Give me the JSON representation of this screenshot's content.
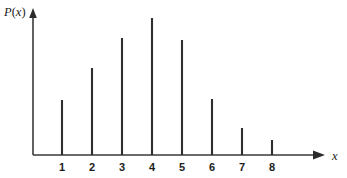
{
  "figure": {
    "background_color": "#ffffff",
    "line_color": "#2e2e2e",
    "axis_color": "#3a3a3a"
  },
  "axes": {
    "y_label_parts": {
      "symbol": "P",
      "open_paren": "(",
      "variable": "x",
      "close_paren": ")"
    },
    "y_label": "P(x)",
    "x_label": "x"
  },
  "chart_data": {
    "type": "bar",
    "title": "",
    "subtitle": "",
    "xlabel": "x",
    "ylabel": "P(x)",
    "categories": [
      "1",
      "2",
      "3",
      "4",
      "5",
      "6",
      "7",
      "8"
    ],
    "x": [
      1,
      2,
      3,
      4,
      5,
      6,
      7,
      8
    ],
    "values": [
      55,
      87,
      117,
      137,
      115,
      56,
      27,
      15
    ],
    "value_unit": "relative pixel height",
    "xlim": [
      0.5,
      8.8
    ],
    "ylim": [
      0,
      150
    ],
    "grid": false,
    "legend": null,
    "tick_labels_x": [
      "1",
      "2",
      "3",
      "4",
      "5",
      "6",
      "7",
      "8"
    ],
    "tick_labels_y": [],
    "annotations": []
  }
}
